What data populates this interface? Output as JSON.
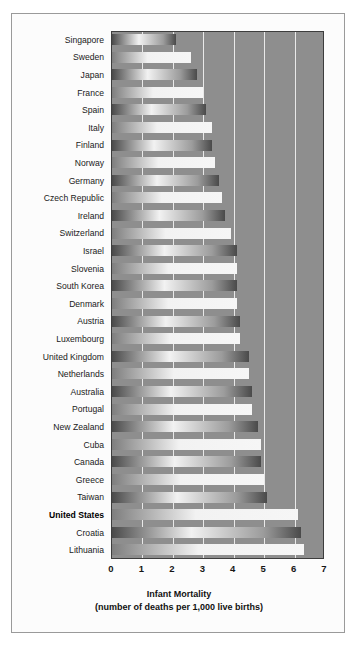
{
  "chart_data": {
    "type": "bar",
    "orientation": "horizontal",
    "title": "",
    "xlabel": "Infant Mortality",
    "xlabel_sub": "(number of deaths per 1,000 live births)",
    "ylabel": "",
    "xlim": [
      0,
      7
    ],
    "xticks": [
      0,
      1,
      2,
      3,
      4,
      5,
      6,
      7
    ],
    "xtick_labels": [
      "0",
      "1",
      "2",
      "3",
      "4",
      "5",
      "6",
      "7"
    ],
    "grid": true,
    "grid_axis": "x",
    "legend": "none",
    "highlight_category": "United States",
    "categories": [
      "Singapore",
      "Sweden",
      "Japan",
      "France",
      "Spain",
      "Italy",
      "Finland",
      "Norway",
      "Germany",
      "Czech Republic",
      "Ireland",
      "Switzerland",
      "Israel",
      "Slovenia",
      "South Korea",
      "Denmark",
      "Austria",
      "Luxembourg",
      "United Kingdom",
      "Netherlands",
      "Australia",
      "Portugal",
      "New Zealand",
      "Cuba",
      "Canada",
      "Greece",
      "Taiwan",
      "United States",
      "Croatia",
      "Lithuania"
    ],
    "values": [
      2.1,
      2.6,
      2.8,
      3.0,
      3.1,
      3.3,
      3.3,
      3.4,
      3.5,
      3.6,
      3.7,
      3.9,
      4.1,
      4.1,
      4.1,
      4.1,
      4.2,
      4.2,
      4.5,
      4.5,
      4.6,
      4.6,
      4.8,
      4.9,
      4.9,
      5.0,
      5.1,
      6.1,
      6.2,
      6.3
    ]
  },
  "style": {
    "plot_background": "#8e8e8e",
    "plot_border": "#3d3d3d",
    "gridline_color": "#e9e9e9",
    "panel_background": "#fcfcfc",
    "panel_border": "#9a9a9a",
    "page_background": "#ffffff",
    "bar_light": "#f2f2f2",
    "bar_dark": "#4a4a4a",
    "label_color": "#1a1a1a"
  }
}
